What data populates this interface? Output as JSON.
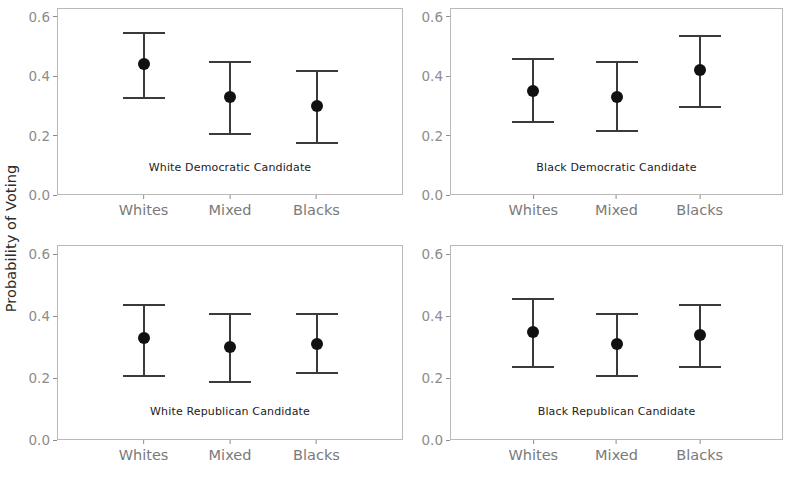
{
  "chart_data": {
    "type": "scatter",
    "title": "",
    "subtitle": "",
    "xlabel": "",
    "ylabel": "Probability of Voting",
    "categories": [
      "Whites",
      "Mixed",
      "Blacks"
    ],
    "ylim": [
      0.0,
      0.63
    ],
    "yticks": [
      "0.0",
      "0.2",
      "0.4",
      "0.6"
    ],
    "ytick_values": [
      0.0,
      0.2,
      0.4,
      0.6
    ],
    "grid": false,
    "legend": "none",
    "marker": "filled-circle",
    "error_bars": "capped",
    "facet_layout": "2x2",
    "panels": [
      {
        "id": "white-democratic-candidate",
        "annotation": "White Democratic Candidate",
        "row": 0,
        "col": 0,
        "points": [
          {
            "category": "Whites",
            "value": 0.44,
            "low": 0.33,
            "high": 0.55
          },
          {
            "category": "Mixed",
            "value": 0.33,
            "low": 0.21,
            "high": 0.45
          },
          {
            "category": "Blacks",
            "value": 0.3,
            "low": 0.18,
            "high": 0.42
          }
        ]
      },
      {
        "id": "black-democratic-candidate",
        "annotation": "Black Democratic Candidate",
        "row": 0,
        "col": 1,
        "points": [
          {
            "category": "Whites",
            "value": 0.35,
            "low": 0.25,
            "high": 0.46
          },
          {
            "category": "Mixed",
            "value": 0.33,
            "low": 0.22,
            "high": 0.45
          },
          {
            "category": "Blacks",
            "value": 0.42,
            "low": 0.3,
            "high": 0.54
          }
        ]
      },
      {
        "id": "white-republican-candidate",
        "annotation": "White Republican Candidate",
        "row": 1,
        "col": 0,
        "points": [
          {
            "category": "Whites",
            "value": 0.33,
            "low": 0.21,
            "high": 0.44
          },
          {
            "category": "Mixed",
            "value": 0.3,
            "low": 0.19,
            "high": 0.41
          },
          {
            "category": "Blacks",
            "value": 0.31,
            "low": 0.22,
            "high": 0.41
          }
        ]
      },
      {
        "id": "black-republican-candidate",
        "annotation": "Black Republican Candidate",
        "row": 1,
        "col": 1,
        "points": [
          {
            "category": "Whites",
            "value": 0.35,
            "low": 0.24,
            "high": 0.46
          },
          {
            "category": "Mixed",
            "value": 0.31,
            "low": 0.21,
            "high": 0.41
          },
          {
            "category": "Blacks",
            "value": 0.34,
            "low": 0.24,
            "high": 0.44
          }
        ]
      }
    ],
    "colors": {
      "point": "#111111",
      "errorbar": "#3a3a3a",
      "panel_border": "#b9b9b9",
      "axis_text": "#7a7a7a",
      "background": "#ffffff"
    }
  },
  "layout": {
    "panel_geometry": [
      {
        "left": 57,
        "top": 8,
        "width": 346,
        "height": 187
      },
      {
        "left": 450,
        "top": 8,
        "width": 333,
        "height": 187
      },
      {
        "left": 57,
        "top": 245,
        "width": 346,
        "height": 195
      },
      {
        "left": 450,
        "top": 245,
        "width": 333,
        "height": 195
      }
    ],
    "annotation_offset_from_top_pct": 0.82
  }
}
